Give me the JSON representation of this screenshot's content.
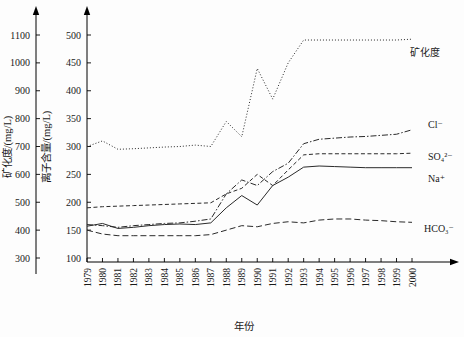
{
  "chart_data": {
    "type": "line",
    "title": "",
    "xlabel": "年份",
    "ylabel_left": "矿化度/(mg/L)",
    "ylabel_right": "离子含量/(mg/L)",
    "grid": false,
    "legend_position": "right-inline",
    "x": [
      1979,
      1980,
      1981,
      1982,
      1983,
      1984,
      1985,
      1986,
      1987,
      1988,
      1989,
      1990,
      1991,
      1992,
      1993,
      1994,
      1995,
      1996,
      1997,
      1998,
      1999,
      2000
    ],
    "xtick_labels": [
      "1979",
      "1980",
      "1981",
      "1982",
      "1983",
      "1984",
      "1985",
      "1986",
      "1987",
      "1988",
      "1989",
      "1990",
      "1991",
      "1992",
      "1993",
      "1994",
      "1995",
      "1996",
      "1997",
      "1998",
      "1999",
      "2000"
    ],
    "left_axis": {
      "label": "矿化度/(mg/L)",
      "ticks": [
        300,
        400,
        500,
        600,
        700,
        800,
        900,
        1000,
        1100
      ],
      "ylim": [
        250,
        1150
      ],
      "unit": "mg/L"
    },
    "right_axis": {
      "label": "离子含量/(mg/L)",
      "ticks": [
        100,
        150,
        200,
        250,
        300,
        350,
        400,
        450,
        500
      ],
      "ylim": [
        75,
        525
      ],
      "unit": "mg/L"
    },
    "series": [
      {
        "name": "矿化度",
        "label": "矿化度",
        "axis": "left",
        "style": "dotted",
        "color": "#2a2a2a",
        "values": [
          700,
          720,
          690,
          692,
          695,
          698,
          700,
          705,
          700,
          790,
          735,
          980,
          870,
          1000,
          1082,
          1082,
          1082,
          1082,
          1082,
          1082,
          1082,
          1085
        ]
      },
      {
        "name": "Cl-",
        "label": "Cl⁻",
        "axis": "right",
        "style": "dash-dot",
        "color": "#2a2a2a",
        "values": [
          160,
          158,
          155,
          158,
          160,
          162,
          163,
          166,
          170,
          215,
          240,
          230,
          255,
          270,
          305,
          313,
          315,
          317,
          318,
          320,
          322,
          330
        ]
      },
      {
        "name": "SO4(2-)",
        "label": "SO₄²⁻",
        "axis": "right",
        "style": "dashed",
        "color": "#2a2a2a",
        "values": [
          190,
          192,
          193,
          194,
          195,
          196,
          197,
          198,
          199,
          215,
          225,
          250,
          230,
          258,
          285,
          287,
          287,
          287,
          287,
          287,
          287,
          288
        ]
      },
      {
        "name": "Na+",
        "label": "Na⁺",
        "axis": "right",
        "style": "solid",
        "color": "#2a2a2a",
        "values": [
          157,
          162,
          153,
          155,
          158,
          160,
          161,
          160,
          163,
          190,
          212,
          195,
          230,
          245,
          263,
          265,
          264,
          263,
          262,
          262,
          262,
          262
        ]
      },
      {
        "name": "HCO3-",
        "label": "HCO₃⁻",
        "axis": "right",
        "style": "long-dash",
        "color": "#2a2a2a",
        "values": [
          150,
          143,
          140,
          140,
          140,
          140,
          140,
          140,
          142,
          150,
          158,
          156,
          162,
          165,
          163,
          168,
          170,
          170,
          168,
          167,
          165,
          164
        ]
      }
    ],
    "series_labels": [
      {
        "text": "矿化度",
        "x": 410,
        "y": 56
      },
      {
        "text": "Cl⁻",
        "x": 428,
        "y": 128
      },
      {
        "text": "SO₄²⁻",
        "x": 428,
        "y": 160
      },
      {
        "text": "Na⁺",
        "x": 428,
        "y": 182
      },
      {
        "text": "HCO₃⁻",
        "x": 424,
        "y": 232
      }
    ]
  }
}
